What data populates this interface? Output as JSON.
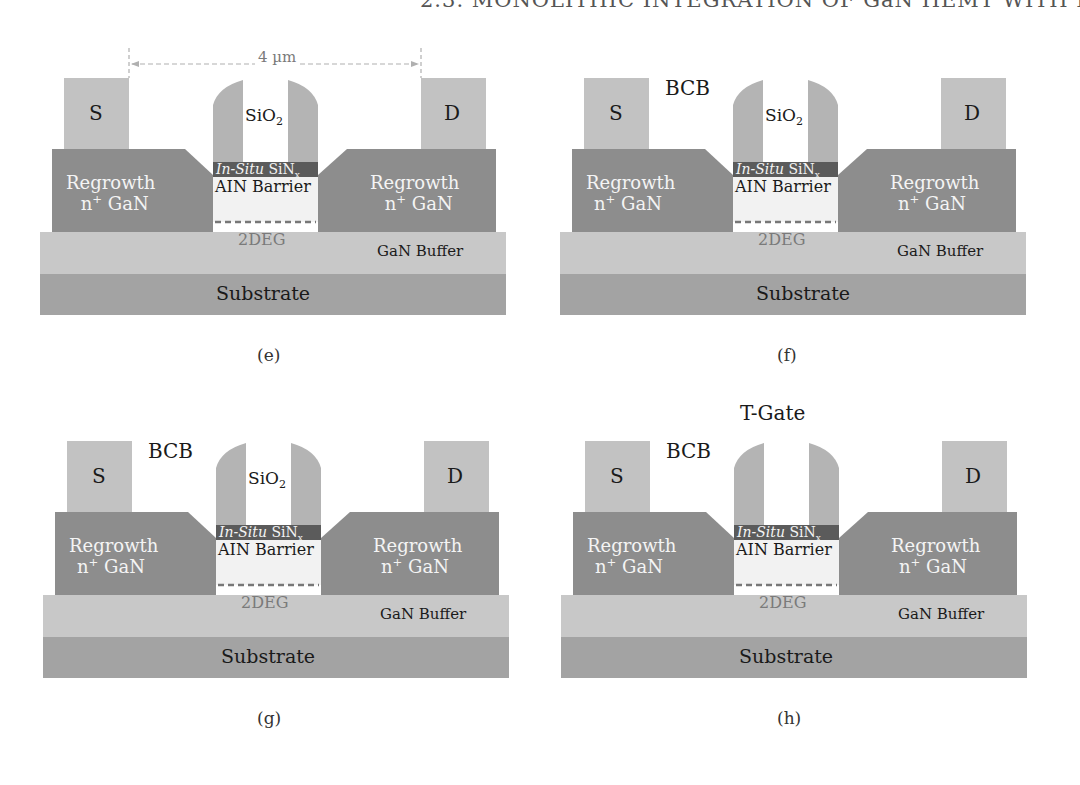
{
  "running_head": "2.3. MONOLITHIC INTEGRATION OF GaN HEMT WITH LED",
  "colors": {
    "contact": "#c2c2c2",
    "regrowth": "#8d8d8d",
    "spacer": "#b4b4b4",
    "sin": "#5b5b5b",
    "barrier": "#f2f2f2",
    "buffer": "#c8c8c8",
    "substrate": "#a3a3a3",
    "dim_line": "#b0b0b0"
  },
  "labels": {
    "source": "S",
    "drain": "D",
    "sio2_main": "SiO",
    "sio2_sub": "2",
    "sin_italic": "In-Situ",
    "sin_main": " SiN",
    "sin_sub": "x",
    "barrier": "AIN Barrier",
    "twodeg": "2DEG",
    "buffer": "GaN Buffer",
    "substrate": "Substrate",
    "regrowth_line1": "Regrowth",
    "regrowth_line2_pre": "n",
    "regrowth_line2_sup": "+",
    "regrowth_line2_post": " GaN",
    "bcb": "BCB",
    "tgate": "T-Gate",
    "dimension": "4 µm"
  },
  "panels": [
    {
      "id": "e",
      "caption": "(e)",
      "show_dimension": true,
      "show_bcb": false,
      "show_tgate": false,
      "show_sio2": true
    },
    {
      "id": "f",
      "caption": "(f)",
      "show_dimension": false,
      "show_bcb": true,
      "show_tgate": false,
      "show_sio2": true
    },
    {
      "id": "g",
      "caption": "(g)",
      "show_dimension": false,
      "show_bcb": true,
      "show_tgate": false,
      "show_sio2": true
    },
    {
      "id": "h",
      "caption": "(h)",
      "show_dimension": false,
      "show_bcb": true,
      "show_tgate": true,
      "show_sio2": false
    }
  ]
}
